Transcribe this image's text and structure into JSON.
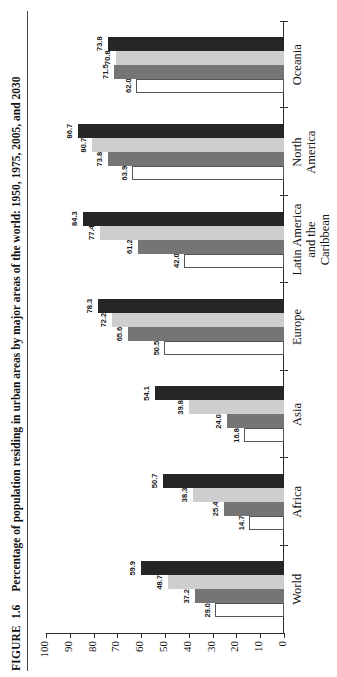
{
  "figure": {
    "label": "FIGURE",
    "number": "1.6",
    "title": "Percentage of population residing in urban areas by major areas of the world: 1950, 1975, 2005, and 2030"
  },
  "axis": {
    "ticks": [
      "100",
      "90",
      "80",
      "70",
      "60",
      "50",
      "40",
      "30",
      "20",
      "10",
      "0"
    ]
  },
  "colors": {
    "series_1950": "#ffffff",
    "series_1975": "#757575",
    "series_2005": "#cecece",
    "series_2030": "#262626",
    "axis": "#2b2b2b"
  },
  "chart_data": {
    "type": "bar",
    "title": "Percentage of population residing in urban areas by major areas of the world: 1950, 1975, 2005, and 2030",
    "xlabel": "",
    "ylabel": "",
    "ylim": [
      0,
      100
    ],
    "yticks": [
      0,
      10,
      20,
      30,
      40,
      50,
      60,
      70,
      80,
      90,
      100
    ],
    "grid": false,
    "legend": "none",
    "categories": [
      "World",
      "Africa",
      "Asia",
      "Europe",
      "Latin America\nand the\nCaribbean",
      "North\nAmerica",
      "Oceania"
    ],
    "series": [
      {
        "name": "1950",
        "values": [
          29.0,
          14.7,
          16.8,
          50.5,
          42.0,
          63.9,
          62.0
        ]
      },
      {
        "name": "1975",
        "values": [
          37.2,
          25.4,
          24.0,
          65.6,
          61.2,
          73.8,
          71.5
        ]
      },
      {
        "name": "2005",
        "values": [
          48.7,
          38.3,
          39.8,
          72.2,
          77.4,
          80.7,
          70.8
        ]
      },
      {
        "name": "2030",
        "values": [
          59.9,
          50.7,
          54.1,
          78.3,
          84.3,
          86.7,
          73.8
        ]
      }
    ],
    "value_labels": [
      [
        "29.0",
        "37.2",
        "48.7",
        "59.9"
      ],
      [
        "14.7",
        "25.4",
        "38.3",
        "50.7"
      ],
      [
        "16.8",
        "24.0",
        "39.8",
        "54.1"
      ],
      [
        "50.5",
        "65.6",
        "72.2",
        "78.3"
      ],
      [
        "42.0",
        "61.2",
        "77.4",
        "84.3"
      ],
      [
        "63.9",
        "73.8",
        "80.7",
        "86.7"
      ],
      [
        "62.0",
        "71.5",
        "70.8",
        "73.8"
      ]
    ]
  }
}
